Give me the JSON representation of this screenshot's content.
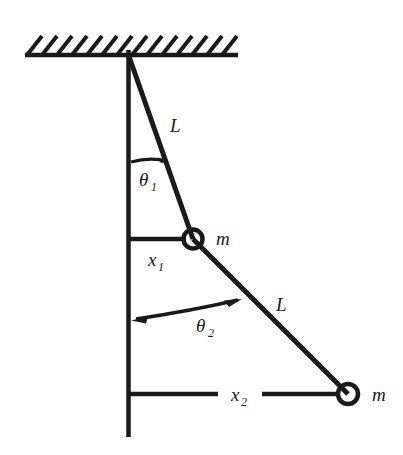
{
  "figure": {
    "type": "physics-diagram",
    "background_color": "#ffffff",
    "ink_color": "#1a1a1a"
  },
  "labels": {
    "rod1_length": "L",
    "rod2_length": "L",
    "angle1": "θ",
    "angle1_sub": "1",
    "angle2": "θ",
    "angle2_sub": "2",
    "mass1": "m",
    "mass2": "m",
    "displacement1": "x",
    "displacement1_sub": "1",
    "displacement2": "x",
    "displacement2_sub": "2"
  },
  "icons": {
    "ceiling": "hatched-support-icon",
    "mass1": "bob-circle-icon",
    "mass2": "bob-circle-icon",
    "angle1_arc": "angle-arrow-icon",
    "angle2_arc": "double-angle-arrow-icon"
  },
  "geometry": {
    "pivot": {
      "x": 128,
      "y": 55
    },
    "mass1": {
      "x": 193,
      "y": 239,
      "radius": 9
    },
    "mass2": {
      "x": 348,
      "y": 394,
      "radius": 10
    },
    "ceiling_line": {
      "x1": 25,
      "y1": 55,
      "x2": 238,
      "y2": 55
    },
    "vertical_line": {
      "x1": 128,
      "y1": 50,
      "x2": 128,
      "y2": 437
    },
    "hatch_count": 14,
    "x1_line": {
      "x1": 128,
      "y1": 239,
      "x2": 186,
      "y2": 239
    },
    "x2_line_left": {
      "x1": 128,
      "y1": 394,
      "x2": 218,
      "y2": 394
    },
    "x2_line_right": {
      "x1": 262,
      "y1": 394,
      "x2": 339,
      "y2": 394
    }
  }
}
